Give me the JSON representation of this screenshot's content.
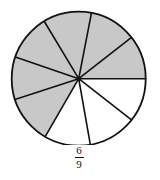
{
  "diagram": {
    "type": "fraction-circle",
    "total_sectors": 9,
    "shaded_sectors": 6,
    "fraction": {
      "numerator": "6",
      "denominator": "9"
    },
    "spoke_angles_deg": [
      0,
      -38,
      -79,
      -121,
      -161,
      162,
      120,
      80,
      38
    ],
    "shaded_flags": [
      true,
      true,
      true,
      true,
      true,
      true,
      false,
      false,
      false
    ],
    "colors": {
      "shade": "#c8c8c8",
      "stroke": "#111111",
      "background": "#ffffff"
    }
  }
}
